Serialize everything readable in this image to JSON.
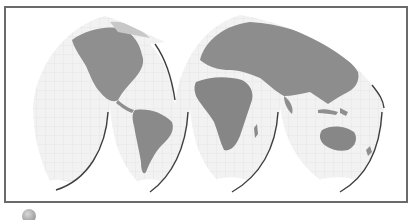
{
  "figure": {
    "type": "world-map",
    "projection": "interrupted-goode-homolosine",
    "style": "grayscale-relief",
    "colors": {
      "frame": "#6a6a6a",
      "ocean": "#f1f1f1",
      "land": "#8e8e8e",
      "graticule": "#d9d9d9",
      "lobe_shadow": "#3a3a3a",
      "ice": "#ffffff"
    },
    "continents": [
      "North America",
      "South America",
      "Europe",
      "Africa",
      "Asia",
      "Australia",
      "Antarctica"
    ]
  },
  "footer": {
    "icon": "globe-icon"
  }
}
